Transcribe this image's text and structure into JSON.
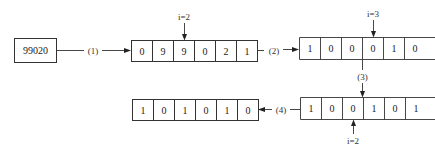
{
  "diagram": {
    "input_box": {
      "value": "99020"
    },
    "steps": {
      "step1": "(1)",
      "step2": "(2)",
      "step3": "(3)",
      "step4": "(4)"
    },
    "array1": {
      "cells": [
        "0",
        "9",
        "9",
        "0",
        "2",
        "1"
      ],
      "pointer": {
        "label": "i=2",
        "index": 2,
        "position": "top"
      }
    },
    "array2": {
      "cells": [
        "1",
        "0",
        "0",
        "0",
        "1",
        "0"
      ],
      "pointer": {
        "label": "i=3",
        "index": 3,
        "position": "top"
      },
      "continues_right": true
    },
    "array3": {
      "cells": [
        "1",
        "0",
        "0",
        "1",
        "0",
        "1"
      ],
      "pointer": {
        "label": "i=2",
        "index": 2,
        "position": "bottom"
      },
      "continues_right": true
    },
    "array4": {
      "cells": [
        "1",
        "0",
        "1",
        "0",
        "1",
        "0"
      ]
    }
  }
}
